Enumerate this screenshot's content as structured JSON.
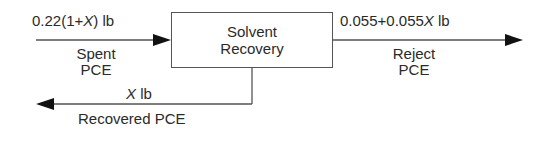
{
  "process_block": {
    "line1": "Solvent",
    "line2": "Recovery"
  },
  "streams": {
    "spent": {
      "quantity_prefix": "0.22(1+",
      "quantity_var": "X",
      "quantity_suffix": ") lb",
      "name_line1": "Spent",
      "name_line2": "PCE"
    },
    "reject": {
      "quantity_prefix": "0.055+0.055",
      "quantity_var": "X",
      "quantity_suffix": " lb",
      "name_line1": "Reject",
      "name_line2": "PCE"
    },
    "recovered": {
      "quantity_var": "X",
      "quantity_suffix": " lb",
      "name": "Recovered PCE"
    }
  },
  "colors": {
    "line": "#555555",
    "arrowhead": "#111111",
    "text": "#2a2a2a"
  }
}
